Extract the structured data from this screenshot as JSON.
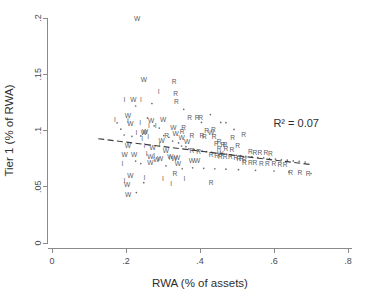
{
  "chart_data": {
    "type": "scatter",
    "title": "",
    "xlabel": "RWA (% of assets)",
    "ylabel": "Tier 1 (% of RWA)",
    "xlim": [
      0,
      0.8
    ],
    "ylim": [
      0,
      0.2
    ],
    "xticks": [
      0,
      0.2,
      0.4,
      0.6,
      0.8
    ],
    "xticklabels": [
      "0",
      ".2",
      ".4",
      ".6",
      ".8"
    ],
    "yticks": [
      0,
      0.05,
      0.1,
      0.15,
      0.2
    ],
    "yticklabels": [
      "0",
      ".05",
      ".1",
      ".15",
      ".2"
    ],
    "grid": false,
    "legend": "none",
    "annotations": [
      {
        "name": "r-squared-label",
        "text": "R² = 0.07",
        "x": 0.66,
        "y": 0.103
      }
    ],
    "fit_line": {
      "name": "linear-fit-dashed",
      "style": "dashed",
      "x0": 0.125,
      "y0": 0.0927,
      "x1": 0.705,
      "y1": 0.0695
    },
    "marker_labels": [
      "W",
      "R",
      "I",
      "."
    ],
    "series": [
      {
        "name": "W",
        "marker": "W",
        "points": [
          [
            0.23,
            0.199
          ],
          [
            0.248,
            0.1445
          ],
          [
            0.22,
            0.127
          ],
          [
            0.205,
            0.1125
          ],
          [
            0.212,
            0.106
          ],
          [
            0.268,
            0.1085
          ],
          [
            0.252,
            0.0985
          ],
          [
            0.248,
            0.0978
          ],
          [
            0.3,
            0.1088
          ],
          [
            0.328,
            0.1018
          ],
          [
            0.334,
            0.0968
          ],
          [
            0.205,
            0.0862
          ],
          [
            0.296,
            0.0905
          ],
          [
            0.272,
            0.0838
          ],
          [
            0.196,
            0.0778
          ],
          [
            0.222,
            0.0782
          ],
          [
            0.308,
            0.0812
          ],
          [
            0.266,
            0.076
          ],
          [
            0.292,
            0.0742
          ],
          [
            0.282,
            0.0738
          ],
          [
            0.32,
            0.076
          ],
          [
            0.33,
            0.0745
          ],
          [
            0.338,
            0.0752
          ],
          [
            0.266,
            0.0706
          ],
          [
            0.34,
            0.07
          ],
          [
            0.212,
            0.0592
          ],
          [
            0.203,
            0.0512
          ],
          [
            0.206,
            0.0422
          ],
          [
            0.35,
            0.0932
          ],
          [
            0.365,
            0.0895
          ],
          [
            0.43,
            0.098
          ],
          [
            0.455,
            0.079
          ],
          [
            0.378,
            0.0728
          ],
          [
            0.392,
            0.0726
          ]
        ]
      },
      {
        "name": "R",
        "marker": "R",
        "points": [
          [
            0.33,
            0.1425
          ],
          [
            0.334,
            0.1322
          ],
          [
            0.336,
            0.125
          ],
          [
            0.372,
            0.1108
          ],
          [
            0.392,
            0.1108
          ],
          [
            0.402,
            0.1105
          ],
          [
            0.356,
            0.1022
          ],
          [
            0.436,
            0.1005
          ],
          [
            0.352,
            0.0985
          ],
          [
            0.31,
            0.095
          ],
          [
            0.378,
            0.0948
          ],
          [
            0.405,
            0.0946
          ],
          [
            0.412,
            0.0944
          ],
          [
            0.418,
            0.0995
          ],
          [
            0.438,
            0.094
          ],
          [
            0.452,
            0.09
          ],
          [
            0.444,
            0.0882
          ],
          [
            0.462,
            0.0872
          ],
          [
            0.468,
            0.0868
          ],
          [
            0.452,
            0.0835
          ],
          [
            0.47,
            0.0832
          ],
          [
            0.486,
            0.0828
          ],
          [
            0.378,
            0.0812
          ],
          [
            0.396,
            0.0806
          ],
          [
            0.43,
            0.0778
          ],
          [
            0.445,
            0.077
          ],
          [
            0.455,
            0.0765
          ],
          [
            0.468,
            0.0762
          ],
          [
            0.482,
            0.076
          ],
          [
            0.497,
            0.0752
          ],
          [
            0.505,
            0.0748
          ],
          [
            0.512,
            0.0744
          ],
          [
            0.52,
            0.074
          ],
          [
            0.536,
            0.0806
          ],
          [
            0.548,
            0.0802
          ],
          [
            0.562,
            0.0798
          ],
          [
            0.578,
            0.0795
          ],
          [
            0.59,
            0.079
          ],
          [
            0.52,
            0.0712
          ],
          [
            0.536,
            0.0708
          ],
          [
            0.548,
            0.0705
          ],
          [
            0.566,
            0.0702
          ],
          [
            0.582,
            0.07
          ],
          [
            0.6,
            0.0698
          ],
          [
            0.616,
            0.0694
          ],
          [
            0.63,
            0.069
          ],
          [
            0.645,
            0.062
          ],
          [
            0.67,
            0.0616
          ],
          [
            0.692,
            0.0612
          ],
          [
            0.43,
            0.053
          ],
          [
            0.332,
            0.0612
          ],
          [
            0.488,
            0.0935
          ],
          [
            0.518,
            0.096
          ],
          [
            0.502,
            0.0862
          ]
        ]
      },
      {
        "name": "I",
        "marker": "I",
        "points": [
          [
            0.196,
            0.1272
          ],
          [
            0.24,
            0.1265
          ],
          [
            0.288,
            0.1342
          ],
          [
            0.17,
            0.1088
          ],
          [
            0.238,
            0.1068
          ],
          [
            0.205,
            0.1082
          ],
          [
            0.262,
            0.1042
          ],
          [
            0.28,
            0.104
          ],
          [
            0.228,
            0.098
          ],
          [
            0.26,
            0.0938
          ],
          [
            0.244,
            0.0918
          ],
          [
            0.29,
            0.087
          ],
          [
            0.25,
            0.0862
          ],
          [
            0.256,
            0.0786
          ],
          [
            0.276,
            0.0768
          ],
          [
            0.318,
            0.0756
          ],
          [
            0.25,
            0.0578
          ],
          [
            0.3,
            0.0568
          ],
          [
            0.322,
            0.0524
          ],
          [
            0.19,
            0.07
          ],
          [
            0.358,
            0.0568
          ],
          [
            0.196,
            0.0552
          ]
        ]
      },
      {
        "name": "dot",
        "marker": ".",
        "points": [
          [
            0.176,
            0.1068
          ],
          [
            0.186,
            0.1012
          ],
          [
            0.195,
            0.096
          ],
          [
            0.226,
            0.1218
          ],
          [
            0.216,
            0.0948
          ],
          [
            0.24,
            0.0952
          ],
          [
            0.258,
            0.1112
          ],
          [
            0.27,
            0.124
          ],
          [
            0.276,
            0.1042
          ],
          [
            0.29,
            0.1022
          ],
          [
            0.302,
            0.0955
          ],
          [
            0.316,
            0.094
          ],
          [
            0.326,
            0.0906
          ],
          [
            0.342,
            0.089
          ],
          [
            0.35,
            0.0862
          ],
          [
            0.362,
            0.0856
          ],
          [
            0.37,
            0.0836
          ],
          [
            0.384,
            0.0832
          ],
          [
            0.396,
            0.0824
          ],
          [
            0.406,
            0.0818
          ],
          [
            0.418,
            0.0812
          ],
          [
            0.432,
            0.0806
          ],
          [
            0.446,
            0.08
          ],
          [
            0.458,
            0.0796
          ],
          [
            0.472,
            0.079
          ],
          [
            0.484,
            0.0784
          ],
          [
            0.498,
            0.078
          ],
          [
            0.51,
            0.0776
          ],
          [
            0.524,
            0.077
          ],
          [
            0.54,
            0.0766
          ],
          [
            0.556,
            0.076
          ],
          [
            0.572,
            0.0756
          ],
          [
            0.588,
            0.075
          ],
          [
            0.604,
            0.0746
          ],
          [
            0.62,
            0.074
          ],
          [
            0.636,
            0.0736
          ],
          [
            0.652,
            0.073
          ],
          [
            0.668,
            0.0726
          ],
          [
            0.684,
            0.072
          ],
          [
            0.7,
            0.0618
          ],
          [
            0.356,
            0.1188
          ],
          [
            0.404,
            0.1072
          ],
          [
            0.428,
            0.1142
          ],
          [
            0.456,
            0.1072
          ],
          [
            0.47,
            0.107
          ],
          [
            0.492,
            0.101
          ],
          [
            0.226,
            0.0728
          ],
          [
            0.24,
            0.0706
          ],
          [
            0.308,
            0.0686
          ],
          [
            0.352,
            0.066
          ],
          [
            0.38,
            0.0668
          ],
          [
            0.41,
            0.0664
          ],
          [
            0.44,
            0.066
          ],
          [
            0.47,
            0.0656
          ],
          [
            0.504,
            0.0652
          ],
          [
            0.55,
            0.0646
          ],
          [
            0.6,
            0.064
          ],
          [
            0.64,
            0.0632
          ],
          [
            0.228,
            0.0448
          ],
          [
            0.248,
            0.0536
          ]
        ]
      }
    ]
  }
}
